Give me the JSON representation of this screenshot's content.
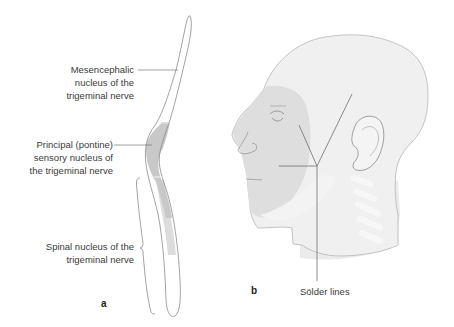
{
  "figure": {
    "panel_a": {
      "letter": "a",
      "labels": {
        "mesencephalic": [
          "Mesencephalic",
          "nucleus of the",
          "trigeminal nerve"
        ],
        "principal": [
          "Principal (pontine)",
          "sensory nucleus of",
          "the trigeminal nerve"
        ],
        "spinal": [
          "Spinal nucleus of the",
          "trigeminal nerve"
        ]
      }
    },
    "panel_b": {
      "letter": "b",
      "labels": {
        "solder": "Sölder lines"
      }
    },
    "colors": {
      "outline": "#8a8a8a",
      "text": "#3a3a3a",
      "principal_fill": "#c9c9c9",
      "spinal_fill": "#dedede",
      "head_fill": "#ececec",
      "face_shade": "#d6d6d6"
    }
  }
}
